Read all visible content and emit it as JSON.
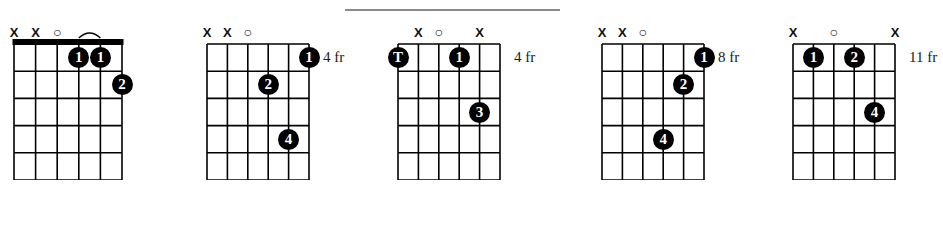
{
  "page": {
    "background_color": "#ffffff",
    "ink_color": "#000000",
    "rule_color": "#8a8a8a",
    "width": 943,
    "height": 229
  },
  "top_rule": {
    "name": "horizontal-rule",
    "x": 345,
    "y": 9,
    "width": 215
  },
  "chart_data": {
    "type": "table",
    "title": "",
    "subtitle": "",
    "xlabel": "",
    "ylabel": "",
    "diagrams": [
      {
        "index": 0,
        "name": "chord-diagram-1",
        "x": 14,
        "grid_width": 108,
        "grid_height": 136,
        "strings": 6,
        "frets": 5,
        "nut": true,
        "fret_label": "",
        "string_markers": [
          "X",
          "X",
          "O",
          "",
          "",
          ""
        ],
        "dots": [
          {
            "string": 4,
            "fret": 1,
            "finger": "1"
          },
          {
            "string": 5,
            "fret": 1,
            "finger": "1"
          },
          {
            "string": 6,
            "fret": 2,
            "finger": "2"
          }
        ],
        "barre": {
          "from_string": 4,
          "to_string": 5,
          "above_nut": true
        }
      },
      {
        "index": 1,
        "name": "chord-diagram-2",
        "x": 207,
        "grid_width": 102,
        "grid_height": 136,
        "strings": 6,
        "frets": 5,
        "nut": false,
        "fret_label": "4 fr",
        "string_markers": [
          "X",
          "X",
          "O",
          "",
          "",
          ""
        ],
        "dots": [
          {
            "string": 6,
            "fret": 1,
            "finger": "1"
          },
          {
            "string": 4,
            "fret": 2,
            "finger": "2"
          },
          {
            "string": 5,
            "fret": 4,
            "finger": "4"
          }
        ],
        "barre": null
      },
      {
        "index": 2,
        "name": "chord-diagram-3",
        "x": 398,
        "grid_width": 102,
        "grid_height": 136,
        "strings": 6,
        "frets": 5,
        "nut": false,
        "fret_label": "4 fr",
        "string_markers": [
          "",
          "X",
          "O",
          "",
          "X",
          ""
        ],
        "dots": [
          {
            "string": 1,
            "fret": 1,
            "finger": "T"
          },
          {
            "string": 4,
            "fret": 1,
            "finger": "1"
          },
          {
            "string": 5,
            "fret": 3,
            "finger": "3"
          }
        ],
        "barre": null
      },
      {
        "index": 3,
        "name": "chord-diagram-4",
        "x": 602,
        "grid_width": 102,
        "grid_height": 136,
        "strings": 6,
        "frets": 5,
        "nut": false,
        "fret_label": "8 fr",
        "string_markers": [
          "X",
          "X",
          "O",
          "",
          "",
          ""
        ],
        "dots": [
          {
            "string": 6,
            "fret": 1,
            "finger": "1"
          },
          {
            "string": 5,
            "fret": 2,
            "finger": "2"
          },
          {
            "string": 4,
            "fret": 4,
            "finger": "4"
          }
        ],
        "barre": null
      },
      {
        "index": 4,
        "name": "chord-diagram-5",
        "x": 793,
        "grid_width": 102,
        "grid_height": 136,
        "strings": 6,
        "frets": 5,
        "nut": false,
        "fret_label": "11 fr",
        "string_markers": [
          "X",
          "",
          "O",
          "",
          "",
          "X"
        ],
        "dots": [
          {
            "string": 2,
            "fret": 1,
            "finger": "1"
          },
          {
            "string": 4,
            "fret": 1,
            "finger": "2"
          },
          {
            "string": 5,
            "fret": 3,
            "finger": "4"
          }
        ],
        "barre": null
      }
    ]
  }
}
